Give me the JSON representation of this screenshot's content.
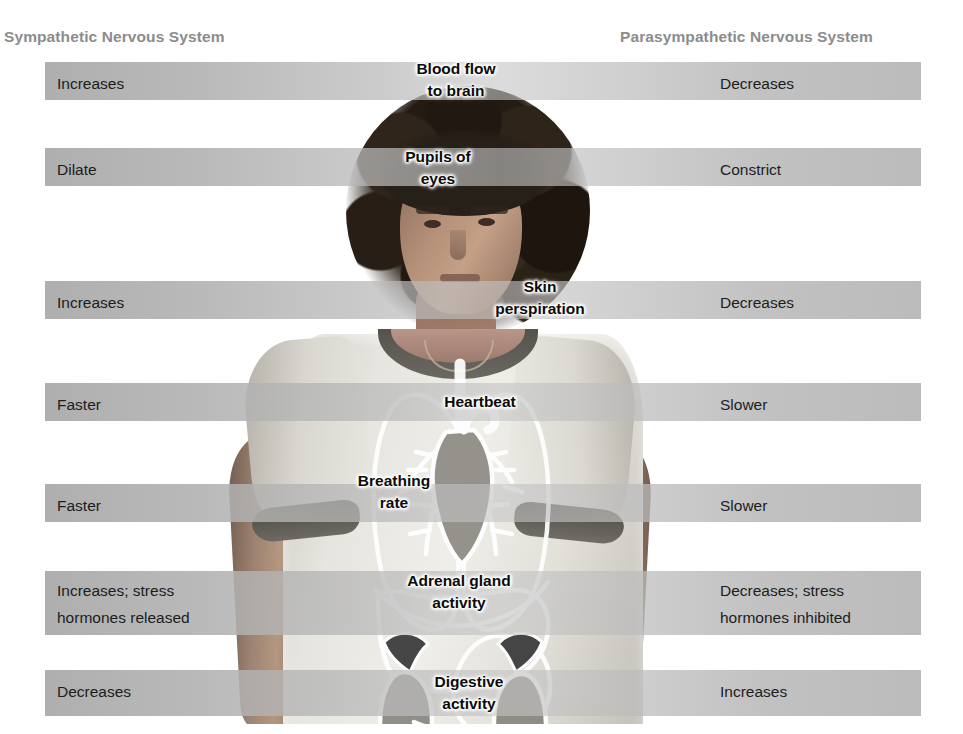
{
  "headers": {
    "left": "Sympathetic Nervous System",
    "right": "Parasympathetic Nervous System"
  },
  "colors": {
    "band": "#b0b0b0",
    "header_text": "#8c8c8c",
    "body_text": "#1d1d1d",
    "callout_text": "#0b0b0b",
    "background": "#ffffff"
  },
  "rows": [
    {
      "function": "Blood flow\nto brain",
      "sympathetic": "Increases",
      "parasympathetic": "Decreases"
    },
    {
      "function": "Pupils of\neyes",
      "sympathetic": "Dilate",
      "parasympathetic": "Constrict"
    },
    {
      "function": "Skin\nperspiration",
      "sympathetic": "Increases",
      "parasympathetic": "Decreases"
    },
    {
      "function": "Heartbeat",
      "sympathetic": "Faster",
      "parasympathetic": "Slower"
    },
    {
      "function": "Breathing\nrate",
      "sympathetic": "Faster",
      "parasympathetic": "Slower"
    },
    {
      "function": "Adrenal gland\nactivity",
      "sympathetic": "Increases; stress\nhormones released",
      "parasympathetic": "Decreases; stress\nhormones inhibited"
    },
    {
      "function": "Digestive\nactivity",
      "sympathetic": "Decreases",
      "parasympathetic": "Increases"
    }
  ],
  "figure": {
    "overlay": "white line-art of internal organs: lungs, heart, liver, stomach, kidneys, adrenal glands"
  }
}
